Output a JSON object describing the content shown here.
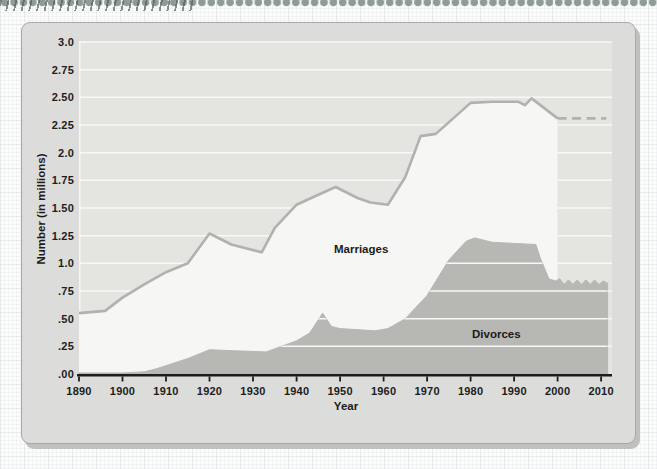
{
  "page": {
    "page_bg": "#fcfcfb",
    "card_bg": "#dcdcda",
    "card_border": "#a8a8a6",
    "card_shadow": "#c0c0be",
    "edge_decoration_color": "#8e9b97"
  },
  "chart_data": {
    "type": "area",
    "title": "",
    "xlabel": "Year",
    "ylabel": "Number (in millions)",
    "xlim": [
      1890,
      2012.5
    ],
    "ylim": [
      0,
      3.0
    ],
    "grid": "horizontal white gridlines every 0.25, visible over plot background and over divorce area",
    "legend_position": "inline-labels",
    "x_ticks": [
      "1890",
      "1900",
      "1910",
      "1920",
      "1930",
      "1940",
      "1950",
      "1960",
      "1970",
      "1980",
      "1990",
      "2000",
      "2010"
    ],
    "y_ticks": [
      {
        "v": 0.0,
        "label": ".00"
      },
      {
        "v": 0.25,
        "label": ".25"
      },
      {
        "v": 0.5,
        "label": ".50"
      },
      {
        "v": 0.75,
        "label": ".75"
      },
      {
        "v": 1.0,
        "label": "1.0"
      },
      {
        "v": 1.25,
        "label": "1.25"
      },
      {
        "v": 1.5,
        "label": "1.50"
      },
      {
        "v": 1.75,
        "label": "1.75"
      },
      {
        "v": 2.0,
        "label": "2.0"
      },
      {
        "v": 2.25,
        "label": "2.25"
      },
      {
        "v": 2.5,
        "label": "2.50"
      },
      {
        "v": 2.75,
        "label": "2.75"
      },
      {
        "v": 3.0,
        "label": "3.0"
      }
    ],
    "series": [
      {
        "name": "Marriages",
        "style": "gray line with white area fill below, dashed estimated tail after 2000",
        "points": [
          [
            1890,
            0.55
          ],
          [
            1896,
            0.57
          ],
          [
            1900,
            0.69
          ],
          [
            1905,
            0.81
          ],
          [
            1910,
            0.92
          ],
          [
            1915,
            1.0
          ],
          [
            1920,
            1.27
          ],
          [
            1925,
            1.17
          ],
          [
            1929,
            1.13
          ],
          [
            1932,
            1.1
          ],
          [
            1935,
            1.32
          ],
          [
            1940,
            1.53
          ],
          [
            1945,
            1.62
          ],
          [
            1949,
            1.69
          ],
          [
            1954,
            1.59
          ],
          [
            1957,
            1.55
          ],
          [
            1961,
            1.53
          ],
          [
            1965,
            1.78
          ],
          [
            1968.5,
            2.15
          ],
          [
            1972,
            2.17
          ],
          [
            1980,
            2.45
          ],
          [
            1985,
            2.46
          ],
          [
            1991,
            2.46
          ],
          [
            1992.5,
            2.43
          ],
          [
            1994,
            2.49
          ],
          [
            2000,
            2.31
          ]
        ],
        "dashed_tail": [
          [
            2000,
            2.31
          ],
          [
            2011.2,
            2.31
          ]
        ]
      },
      {
        "name": "Divorces",
        "style": "solid gray filled area, slightly wavy estimated top after 2000",
        "points": [
          [
            1890,
            0.01
          ],
          [
            1900,
            0.01
          ],
          [
            1905,
            0.02
          ],
          [
            1908,
            0.05
          ],
          [
            1915,
            0.14
          ],
          [
            1920,
            0.22
          ],
          [
            1926,
            0.21
          ],
          [
            1933,
            0.2
          ],
          [
            1940,
            0.3
          ],
          [
            1943,
            0.37
          ],
          [
            1946,
            0.55
          ],
          [
            1948,
            0.43
          ],
          [
            1950,
            0.41
          ],
          [
            1958,
            0.39
          ],
          [
            1961,
            0.41
          ],
          [
            1965,
            0.5
          ],
          [
            1970,
            0.71
          ],
          [
            1975,
            1.03
          ],
          [
            1979,
            1.2
          ],
          [
            1981,
            1.23
          ],
          [
            1985,
            1.19
          ],
          [
            1990,
            1.18
          ],
          [
            1995,
            1.17
          ],
          [
            1996,
            1.05
          ],
          [
            1998,
            0.86
          ],
          [
            1999.5,
            0.84
          ],
          [
            2000.5,
            0.86
          ],
          [
            2001.5,
            0.81
          ],
          [
            2002.5,
            0.85
          ],
          [
            2003.5,
            0.81
          ],
          [
            2004.5,
            0.85
          ],
          [
            2005.5,
            0.81
          ],
          [
            2006.5,
            0.85
          ],
          [
            2007.5,
            0.81
          ],
          [
            2008.5,
            0.85
          ],
          [
            2009.5,
            0.81
          ],
          [
            2010.5,
            0.84
          ],
          [
            2011.5,
            0.82
          ]
        ]
      }
    ],
    "colors": {
      "plot_bg": "#e4e4e1",
      "gridline": "#f8f8f6",
      "marriage_fill": "#f6f6f4",
      "marriage_line": "#b1b1ae",
      "divorce_fill": "#b7b7b4",
      "axis": "#1c1c1c",
      "text": "#1d1d1d"
    }
  }
}
